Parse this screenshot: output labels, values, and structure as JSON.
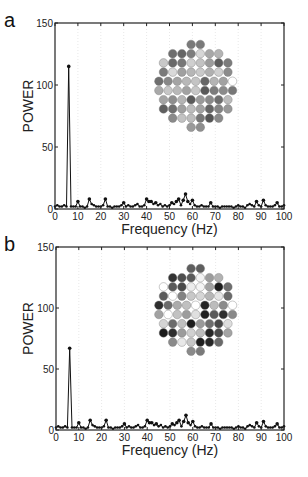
{
  "panels": [
    {
      "label": "a",
      "xlabel": "Frequency (Hz)",
      "ylabel": "POWER",
      "box": {
        "x0": 55,
        "y0": 23,
        "x1": 284,
        "y1": 209
      },
      "grid_colors": [
        [
          2,
          2,
          2,
          2,
          2,
          2,
          2,
          2,
          2,
          2,
          2,
          2,
          2,
          2,
          2,
          2,
          2,
          2,
          2,
          2,
          2,
          2,
          2,
          2,
          2,
          2,
          2,
          2,
          2,
          2,
          2,
          2,
          2,
          2,
          2,
          2,
          2,
          2,
          2,
          2,
          2,
          2,
          2,
          2,
          2,
          2,
          2,
          2,
          2,
          2,
          2,
          2,
          2,
          2,
          2,
          2,
          2,
          2,
          2,
          2,
          2,
          2,
          2,
          2,
          2,
          2,
          2,
          2,
          2,
          2,
          2,
          2,
          2,
          2,
          2,
          2,
          2,
          2,
          2,
          2,
          2,
          2,
          2,
          2,
          2,
          2,
          2,
          2
        ]
      ],
      "cells": [
        [
          null,
          null,
          null,
          "#7a7a7a",
          "#7a7a7a",
          null,
          null,
          null
        ],
        [
          null,
          "#6e6e6e",
          "#666666",
          "#7d7d7d",
          "#d6d6d6",
          "#a8a8a8",
          "#b4b4b4",
          null
        ],
        [
          "#c8c8c8",
          "#6a6a6a",
          "#777777",
          "#cfcfcf",
          "#c2c2c2",
          "#9c9c9c",
          "#5e5e5e",
          "#7c7c7c"
        ],
        [
          "#7a7a7a",
          "#d9d9d9",
          "#a0a0a0",
          "#b6b6b6",
          "#c9c9c9",
          "#b0b0b0",
          "#cfcfcf",
          "#8c8c8c"
        ],
        [
          "#6e6e6e",
          "#888888",
          "#a4a4a4",
          "#b8b8b8",
          "#c4c4c4",
          "#666666",
          "#b4b4b4",
          "#a2a2a2",
          "#ffffff"
        ],
        [
          "#a9a9a9",
          "#c6c6c6",
          "#b8b8b8",
          "#a2a2a2",
          "#c7c7c7",
          "#595959",
          "#7c7c7c",
          "#8b8b8b",
          "#777777"
        ],
        [
          "#a4a4a4",
          "#8e8e8e",
          "#b4b4b4",
          "#5a5a5a",
          "#9a9a9a",
          "#8a8a8a",
          "#6e6e6e",
          "#bcbcbc"
        ],
        [
          "#5f5f5f",
          "#6f6f6f",
          "#a0a0a0",
          "#bcbcbc",
          "#a2a2a2",
          "#666666",
          "#848484",
          "#999999"
        ],
        [
          null,
          "#8a8a8a",
          "#c2c2c2",
          "#bdbdbd",
          "#777777",
          "#555555",
          "#8a8a8a",
          null
        ],
        [
          null,
          null,
          null,
          "#9a9a9a",
          "#8e8e8e",
          null,
          null,
          null
        ]
      ]
    },
    {
      "label": "b",
      "xlabel": "Frequency (Hz)",
      "ylabel": "POWER",
      "box": {
        "x0": 56,
        "y0": 247,
        "x1": 284,
        "y1": 430
      },
      "cells": [
        [
          null,
          null,
          null,
          "#5e5e5e",
          "#5e5e5e",
          null,
          null,
          null
        ],
        [
          null,
          "#333333",
          "#4e4e4e",
          "#5a5a5a",
          "#f2f2f2",
          "#9c9c9c",
          "#b2b2b2",
          null
        ],
        [
          "#ffffff",
          "#5a5a5a",
          "#4a4a4a",
          "#ececec",
          "#f4f4f4",
          "#a2a2a2",
          "#1e1e1e",
          "#6e6e6e"
        ],
        [
          "#5a5a5a",
          "#ffffff",
          "#838383",
          "#c8c8c8",
          "#d6d6d6",
          "#b6b6b6",
          "#e4e4e4",
          "#6a6a6a"
        ],
        [
          "#2e2e2e",
          "#6c6c6c",
          "#ababab",
          "#c0c0c0",
          "#ffffff",
          "#262626",
          "#bcbcbc",
          "#8a8a8a",
          "#ffffff"
        ],
        [
          "#a2a2a2",
          "#ffffff",
          "#c2c2c2",
          "#9c9c9c",
          "#e0e0e0",
          "#202020",
          "#5a5a5a",
          "#2e2e2e",
          "#888888"
        ],
        [
          "#d4d4d4",
          "#6c6c6c",
          "#c0c0c0",
          "#1e1e1e",
          "#9a9a9a",
          "#6e6e6e",
          "#4a4a4a",
          "#dedede"
        ],
        [
          "#1a1a1a",
          "#2e2e2e",
          "#9c9c9c",
          "#d0d0d0",
          "#bcbcbc",
          "#262626",
          "#4a4a4a",
          "#a4a4a4"
        ],
        [
          null,
          "#8a8a8a",
          "#e8e8e8",
          "#c6c6c6",
          "#1e1e1e",
          "#262626",
          "#6a6a6a",
          null
        ],
        [
          null,
          null,
          null,
          "#8a8a8a",
          "#7a7a7a",
          null,
          null,
          null
        ]
      ]
    }
  ],
  "chart_data": [
    {
      "type": "line",
      "title": "a",
      "xlabel": "Frequency (Hz)",
      "ylabel": "POWER",
      "xlim": [
        0,
        100
      ],
      "ylim": [
        0,
        150
      ],
      "xticks": [
        0,
        10,
        20,
        30,
        40,
        50,
        60,
        70,
        80,
        90,
        100
      ],
      "yticks": [
        0,
        50,
        100,
        150
      ],
      "grid": "vertical dotted",
      "series": [
        {
          "name": "power spectrum",
          "x": [
            0,
            1,
            2,
            3,
            4,
            5,
            6,
            7,
            8,
            9,
            10,
            11,
            12,
            13,
            14,
            15,
            16,
            17,
            18,
            19,
            20,
            21,
            22,
            23,
            24,
            25,
            26,
            27,
            28,
            29,
            30,
            31,
            32,
            33,
            34,
            35,
            36,
            37,
            38,
            39,
            40,
            41,
            42,
            43,
            44,
            45,
            46,
            47,
            48,
            49,
            50,
            51,
            52,
            53,
            54,
            55,
            56,
            57,
            58,
            59,
            60,
            61,
            62,
            63,
            64,
            65,
            66,
            67,
            68,
            69,
            70,
            71,
            72,
            73,
            74,
            75,
            76,
            77,
            78,
            79,
            80,
            81,
            82,
            83,
            84,
            85,
            86,
            87,
            88,
            89,
            90,
            91,
            92,
            93,
            94,
            95,
            96,
            97,
            98,
            99,
            100
          ],
          "values": [
            2,
            3,
            2,
            2,
            3,
            2,
            115,
            2,
            2,
            2,
            6,
            2,
            2,
            1,
            2,
            8,
            4,
            3,
            2,
            2,
            2,
            3,
            8,
            2,
            2,
            1,
            2,
            2,
            2,
            3,
            5,
            2,
            3,
            2,
            2,
            3,
            4,
            2,
            2,
            3,
            8,
            6,
            6,
            4,
            5,
            3,
            4,
            2,
            3,
            2,
            3,
            5,
            4,
            6,
            8,
            3,
            7,
            12,
            6,
            4,
            7,
            3,
            2,
            2,
            3,
            2,
            2,
            2,
            5,
            2,
            2,
            2,
            1,
            2,
            2,
            2,
            2,
            2,
            1,
            2,
            3,
            2,
            2,
            1,
            3,
            4,
            3,
            2,
            6,
            3,
            2,
            7,
            3,
            2,
            2,
            2,
            3,
            5,
            2,
            2,
            3
          ],
          "peak": {
            "x": 6,
            "y": 115
          }
        }
      ],
      "inset": "8x10 hexagonal array of grayscale circles (power map)"
    },
    {
      "type": "line",
      "title": "b",
      "xlabel": "Frequency (Hz)",
      "ylabel": "POWER",
      "xlim": [
        0,
        100
      ],
      "ylim": [
        0,
        150
      ],
      "xticks": [
        0,
        10,
        20,
        30,
        40,
        50,
        60,
        70,
        80,
        90,
        100
      ],
      "yticks": [
        0,
        50,
        100,
        150
      ],
      "grid": "vertical dotted",
      "series": [
        {
          "name": "power spectrum",
          "x": [
            0,
            1,
            2,
            3,
            4,
            5,
            6,
            7,
            8,
            9,
            10,
            11,
            12,
            13,
            14,
            15,
            16,
            17,
            18,
            19,
            20,
            21,
            22,
            23,
            24,
            25,
            26,
            27,
            28,
            29,
            30,
            31,
            32,
            33,
            34,
            35,
            36,
            37,
            38,
            39,
            40,
            41,
            42,
            43,
            44,
            45,
            46,
            47,
            48,
            49,
            50,
            51,
            52,
            53,
            54,
            55,
            56,
            57,
            58,
            59,
            60,
            61,
            62,
            63,
            64,
            65,
            66,
            67,
            68,
            69,
            70,
            71,
            72,
            73,
            74,
            75,
            76,
            77,
            78,
            79,
            80,
            81,
            82,
            83,
            84,
            85,
            86,
            87,
            88,
            89,
            90,
            91,
            92,
            93,
            94,
            95,
            96,
            97,
            98,
            99,
            100
          ],
          "values": [
            2,
            3,
            2,
            2,
            3,
            2,
            67,
            2,
            2,
            2,
            6,
            2,
            2,
            1,
            2,
            8,
            4,
            3,
            2,
            2,
            2,
            3,
            8,
            2,
            2,
            1,
            2,
            2,
            2,
            3,
            5,
            2,
            3,
            2,
            2,
            3,
            4,
            2,
            2,
            3,
            8,
            6,
            6,
            4,
            5,
            3,
            4,
            2,
            3,
            2,
            3,
            5,
            4,
            6,
            8,
            3,
            7,
            12,
            6,
            4,
            7,
            3,
            2,
            2,
            3,
            2,
            2,
            2,
            5,
            2,
            2,
            2,
            1,
            2,
            2,
            2,
            2,
            2,
            1,
            2,
            3,
            2,
            2,
            1,
            3,
            4,
            3,
            2,
            6,
            3,
            2,
            7,
            3,
            2,
            2,
            2,
            3,
            5,
            2,
            2,
            3
          ],
          "peak": {
            "x": 6,
            "y": 67
          }
        }
      ],
      "inset": "8x10 hexagonal array of grayscale circles (power map)"
    }
  ]
}
